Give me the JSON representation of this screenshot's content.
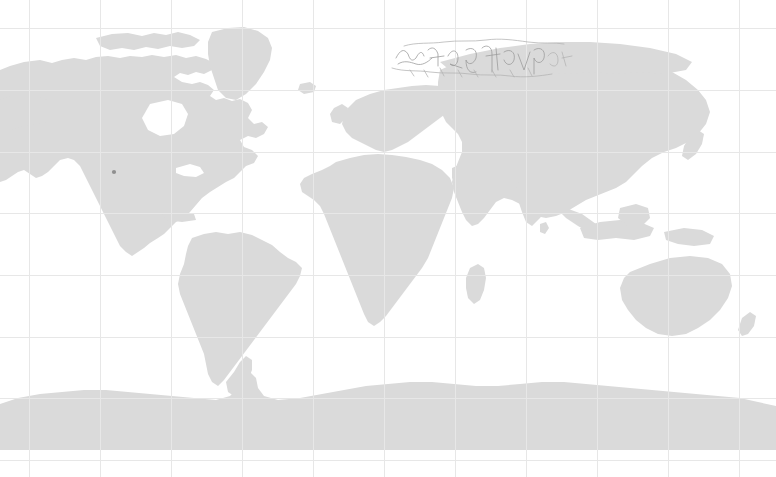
{
  "map": {
    "title": "World Map",
    "projection": "equirectangular",
    "canvas": {
      "width": 776,
      "height": 477
    },
    "background_color": "#ffffff",
    "land_color": "#dadada",
    "grid_color": "#e7e7e7",
    "annotation_color": "#9a9a9a",
    "marker_color": "#8f8f8f",
    "graticule": {
      "vertical_spacing_px": 71,
      "horizontal_spacing_px": 61.5,
      "vertical_lines_px": [
        29,
        100,
        171,
        242,
        313,
        384,
        455,
        526,
        597,
        668,
        739
      ],
      "horizontal_lines_px": [
        28,
        90,
        152,
        213,
        275,
        337,
        398,
        460
      ],
      "longitude_step_deg": 30,
      "latitude_step_deg": 30,
      "visible": true
    },
    "landmasses": [
      {
        "name": "north-america",
        "label": "North America"
      },
      {
        "name": "greenland",
        "label": "Greenland"
      },
      {
        "name": "south-america",
        "label": "South America"
      },
      {
        "name": "africa",
        "label": "Africa"
      },
      {
        "name": "europe",
        "label": "Europe"
      },
      {
        "name": "asia",
        "label": "Asia"
      },
      {
        "name": "australia",
        "label": "Australia"
      },
      {
        "name": "antarctica",
        "label": "Antarctica"
      },
      {
        "name": "madagascar",
        "label": "Madagascar"
      },
      {
        "name": "japan",
        "label": "Japan"
      },
      {
        "name": "new-zealand",
        "label": "New Zealand"
      },
      {
        "name": "british-isles",
        "label": "British Isles"
      },
      {
        "name": "indonesia",
        "label": "Indonesia"
      },
      {
        "name": "new-guinea",
        "label": "New Guinea"
      },
      {
        "name": "iceland",
        "label": "Iceland"
      },
      {
        "name": "cuba",
        "label": "Cuba"
      },
      {
        "name": "sri-lanka",
        "label": "Sri Lanka"
      }
    ],
    "markers": [
      {
        "name": "western-us-marker",
        "x": 114,
        "y": 172,
        "r": 2.1
      }
    ],
    "annotation": {
      "name": "arctic-scribble",
      "description": "faint handwritten-style scribble over arctic siberia",
      "bounds": {
        "x": 392,
        "y": 38,
        "width": 180,
        "height": 40
      }
    }
  }
}
